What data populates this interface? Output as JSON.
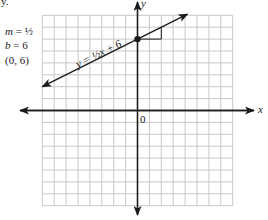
{
  "figure": {
    "top_fragment": "y.",
    "side_notes": [
      {
        "var": "m",
        "eq": "=",
        "value": "½"
      },
      {
        "var": "b",
        "eq": "=",
        "value": "6"
      },
      {
        "text": "(0, 6)"
      }
    ],
    "equation_label": "y = ½x + 6",
    "origin_label": "0",
    "x_axis_label": "x",
    "y_axis_label": "y"
  },
  "chart_data": {
    "type": "line",
    "title": "",
    "equation": "y = 1/2 x + 6",
    "slope": 0.5,
    "y_intercept": 6,
    "highlighted_point": {
      "x": 0,
      "y": 6,
      "label": "(0, 6)"
    },
    "slope_triangle": {
      "run": 2,
      "rise": 1,
      "from": [
        0,
        6
      ],
      "corner": [
        2,
        6
      ],
      "to": [
        2,
        7
      ]
    },
    "line_segment": {
      "x_start": -8,
      "y_start": 2,
      "x_end": 4.2,
      "y_end": 8.1,
      "arrows": "both"
    },
    "xlim": [
      -8,
      8
    ],
    "ylim": [
      -8,
      8
    ],
    "grid": true,
    "grid_step": 1,
    "xlabel": "x",
    "ylabel": "y",
    "tick_labels": [
      "0"
    ],
    "colors": {
      "grid": "#c8c8c8",
      "axis": "#1a1a1a",
      "line": "#1a1a1a"
    }
  }
}
